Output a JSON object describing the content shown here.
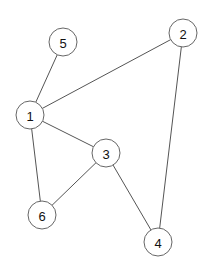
{
  "graph": {
    "nodes": [
      {
        "id": "1",
        "label": "1",
        "x": 30,
        "y": 115,
        "r": 14
      },
      {
        "id": "2",
        "label": "2",
        "x": 183,
        "y": 33,
        "r": 14
      },
      {
        "id": "3",
        "label": "3",
        "x": 106,
        "y": 153,
        "r": 14
      },
      {
        "id": "4",
        "label": "4",
        "x": 158,
        "y": 242,
        "r": 14
      },
      {
        "id": "5",
        "label": "5",
        "x": 63,
        "y": 42,
        "r": 14
      },
      {
        "id": "6",
        "label": "6",
        "x": 42,
        "y": 215,
        "r": 14
      }
    ],
    "edges": [
      {
        "from": "1",
        "to": "5"
      },
      {
        "from": "1",
        "to": "2"
      },
      {
        "from": "1",
        "to": "3"
      },
      {
        "from": "1",
        "to": "6"
      },
      {
        "from": "3",
        "to": "6"
      },
      {
        "from": "3",
        "to": "4"
      },
      {
        "from": "2",
        "to": "4"
      }
    ]
  }
}
